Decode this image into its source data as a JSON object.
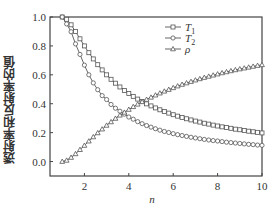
{
  "chart_data": {
    "type": "line",
    "title": "",
    "xlabel": "n",
    "ylabel": "透射率和反射率的值",
    "xlim": [
      0.45,
      10
    ],
    "ylim": [
      -0.1,
      1.0
    ],
    "xticks": [
      2,
      4,
      6,
      8,
      10
    ],
    "xtick_labels": [
      "2",
      "4",
      "6",
      "8",
      "10"
    ],
    "yticks": [
      0.0,
      0.2,
      0.4,
      0.6,
      0.8,
      1.0
    ],
    "ytick_labels": [
      "0.0",
      "0.2",
      "0.4",
      "0.6",
      "0.8",
      "1.0"
    ],
    "grid": false,
    "legend_position": "upper right",
    "x": [
      1.0,
      1.2,
      1.4,
      1.6,
      1.8,
      2.0,
      2.2,
      2.4,
      2.6,
      2.8,
      3.0,
      3.2,
      3.4,
      3.6,
      3.8,
      4.0,
      4.2,
      4.4,
      4.6,
      4.8,
      5.0,
      5.2,
      5.4,
      5.6,
      5.8,
      6.0,
      6.2,
      6.4,
      6.6,
      6.8,
      7.0,
      7.2,
      7.4,
      7.6,
      7.8,
      8.0,
      8.2,
      8.4,
      8.6,
      8.8,
      9.0,
      9.2,
      9.4,
      9.6,
      9.8,
      10.0
    ],
    "series": [
      {
        "name": "T1",
        "label_main": "T",
        "label_sub": "1",
        "marker": "square",
        "values": [
          1.0,
          0.984,
          0.946,
          0.899,
          0.849,
          0.8,
          0.753,
          0.71,
          0.67,
          0.634,
          0.6,
          0.569,
          0.542,
          0.516,
          0.492,
          0.471,
          0.451,
          0.432,
          0.415,
          0.399,
          0.385,
          0.371,
          0.358,
          0.346,
          0.335,
          0.324,
          0.314,
          0.305,
          0.296,
          0.288,
          0.28,
          0.273,
          0.265,
          0.259,
          0.252,
          0.246,
          0.24,
          0.235,
          0.23,
          0.224,
          0.22,
          0.215,
          0.21,
          0.206,
          0.202,
          0.198
        ]
      },
      {
        "name": "T2",
        "label_main": "T",
        "label_sub": "2",
        "marker": "circle",
        "values": [
          1.0,
          0.952,
          0.898,
          0.814,
          0.741,
          0.667,
          0.6,
          0.544,
          0.497,
          0.456,
          0.429,
          0.395,
          0.369,
          0.348,
          0.328,
          0.308,
          0.293,
          0.276,
          0.262,
          0.249,
          0.238,
          0.227,
          0.217,
          0.208,
          0.201,
          0.193,
          0.186,
          0.18,
          0.174,
          0.168,
          0.163,
          0.158,
          0.153,
          0.149,
          0.145,
          0.142,
          0.138,
          0.134,
          0.131,
          0.128,
          0.125,
          0.122,
          0.119,
          0.117,
          0.114,
          0.112
        ]
      },
      {
        "name": "ρ",
        "label_main": "ρ",
        "label_sub": "",
        "marker": "triangle",
        "values": [
          0.0,
          0.008,
          0.028,
          0.053,
          0.082,
          0.111,
          0.141,
          0.17,
          0.198,
          0.224,
          0.25,
          0.274,
          0.298,
          0.32,
          0.34,
          0.36,
          0.379,
          0.396,
          0.413,
          0.429,
          0.444,
          0.459,
          0.473,
          0.486,
          0.498,
          0.51,
          0.522,
          0.533,
          0.543,
          0.553,
          0.563,
          0.572,
          0.581,
          0.589,
          0.597,
          0.605,
          0.613,
          0.62,
          0.627,
          0.634,
          0.64,
          0.646,
          0.652,
          0.658,
          0.664,
          0.669
        ]
      }
    ]
  },
  "style": {
    "line_color": "#555555",
    "axis_color": "#444444",
    "text_color": "#333333"
  }
}
